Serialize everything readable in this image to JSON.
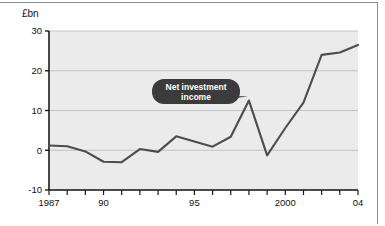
{
  "figure": {
    "unit_label": "£bn",
    "background_color": "#ffffff",
    "plot_background_color": "#ebebeb",
    "line_color": "#4d4d4d",
    "grid_color": "#b9b9b9",
    "axis_color": "#1a1a1a",
    "callout_fill": "#3b3b3b",
    "callout_text_color": "#ffffff"
  },
  "chart_data": {
    "type": "line",
    "title": "",
    "subtitle": "",
    "xlabel": "",
    "ylabel": "£bn",
    "ylim": [
      -10,
      30
    ],
    "xlim": [
      1987,
      2004
    ],
    "yticks": [
      30,
      20,
      10,
      0,
      -10
    ],
    "ytick_labels": [
      "30",
      "20",
      "10",
      "0",
      "-10"
    ],
    "xticks": [
      1987,
      1988,
      1989,
      1990,
      1991,
      1992,
      1993,
      1994,
      1995,
      1996,
      1997,
      1998,
      1999,
      2000,
      2001,
      2002,
      2003,
      2004
    ],
    "xtick_labels": [
      {
        "year": 1987,
        "label": "1987"
      },
      {
        "year": 1990,
        "label": "90"
      },
      {
        "year": 1995,
        "label": "95"
      },
      {
        "year": 2000,
        "label": "2000"
      },
      {
        "year": 2004,
        "label": "04"
      }
    ],
    "grid": true,
    "grid_axis": "y",
    "legend": false,
    "series": [
      {
        "name": "Net investment income",
        "x": [
          1987,
          1988,
          1989,
          1990,
          1991,
          1992,
          1993,
          1994,
          1995,
          1996,
          1997,
          1998,
          1999,
          2000,
          2001,
          2002,
          2003,
          2004
        ],
        "values": [
          1.2,
          1.0,
          -0.3,
          -2.9,
          -3.0,
          0.3,
          -0.4,
          3.5,
          2.2,
          0.9,
          3.4,
          12.5,
          -1.3,
          5.6,
          12.0,
          24.0,
          24.6,
          26.5
        ]
      }
    ],
    "annotations": [
      {
        "type": "callout",
        "text_lines": [
          "Net investment",
          "income"
        ],
        "points_to_year": 1998,
        "points_to_value": 12.5
      }
    ]
  }
}
